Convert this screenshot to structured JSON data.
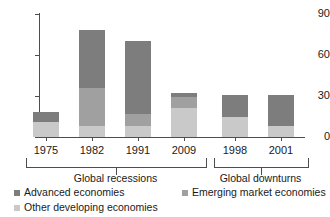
{
  "chart_data": {
    "type": "bar",
    "subtype": "stacked-bar",
    "title": "",
    "xlabel": "",
    "ylabel": "",
    "ylim": [
      0,
      90
    ],
    "yticks": [
      0,
      30,
      60,
      90
    ],
    "grid": false,
    "legend_position": "bottom-left",
    "categories": [
      "1975",
      "1982",
      "1991",
      "2009",
      "1998",
      "2001"
    ],
    "series": [
      {
        "name": "Advanced economies",
        "color": "#7d7d7d",
        "values": [
          7,
          42,
          53,
          3,
          16,
          23
        ]
      },
      {
        "name": "Emerging market economies",
        "color": "#a0a0a0",
        "values": [
          0,
          28,
          9,
          8,
          0,
          0
        ]
      },
      {
        "name": "Other developing economies",
        "color": "#c9c9c9",
        "values": [
          11,
          8,
          8,
          21,
          15,
          8
        ]
      }
    ],
    "totals": [
      18,
      78,
      70,
      32,
      31,
      31
    ],
    "groups": [
      {
        "label": "Global recessions",
        "categories": [
          "1975",
          "1982",
          "1991",
          "2009"
        ]
      },
      {
        "label": "Global downturns",
        "categories": [
          "1998",
          "2001"
        ]
      }
    ]
  },
  "axis": {
    "y_tick_labels": [
      "90",
      "60",
      "30",
      "0"
    ]
  },
  "legend": {
    "items": [
      {
        "label": "Advanced economies",
        "color": "#7d7d7d"
      },
      {
        "label": "Emerging market economies",
        "color": "#a0a0a0"
      },
      {
        "label": "Other developing economies",
        "color": "#c9c9c9"
      }
    ]
  }
}
